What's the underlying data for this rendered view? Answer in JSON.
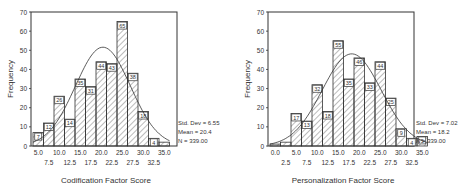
{
  "chart_data": [
    {
      "type": "bar",
      "subtype": "histogram",
      "title": "",
      "xlabel": "Codification Factor Score",
      "ylabel": "Frequency",
      "ylim": [
        0,
        70
      ],
      "yticks": [
        0,
        10,
        20,
        30,
        40,
        50,
        60,
        70
      ],
      "xticks_top_row": [
        "5.0",
        "10.0",
        "15.0",
        "20.0",
        "25.0",
        "30.0",
        "35.0"
      ],
      "xticks_bottom_row": [
        "7.5",
        "12.5",
        "17.5",
        "22.5",
        "27.5",
        "32.5"
      ],
      "categories": [
        5.0,
        7.5,
        10.0,
        12.5,
        15.0,
        17.5,
        20.0,
        22.5,
        25.0,
        27.5,
        30.0,
        32.5,
        35.0
      ],
      "values": [
        7,
        12,
        26,
        14,
        35,
        31,
        44,
        43,
        65,
        38,
        18,
        4,
        2
      ],
      "labels": [
        "7",
        "12",
        "26",
        "14",
        "35",
        "31",
        "44",
        "43",
        "65",
        "38",
        "18",
        "4",
        ""
      ],
      "normal_curve": {
        "mean": 20.4,
        "std": 6.55,
        "n": 339
      },
      "stats": [
        "Std. Dev = 6.55",
        "Mean = 20.4",
        "N = 339.00"
      ],
      "grid": false,
      "bar_fill": "diagonal-hatch"
    },
    {
      "type": "bar",
      "subtype": "histogram",
      "title": "",
      "xlabel": "Personalization Factor Score",
      "ylabel": "Frequency",
      "ylim": [
        0,
        70
      ],
      "yticks": [
        0,
        10,
        20,
        30,
        40,
        50,
        60,
        70
      ],
      "xticks_top_row": [
        "0.0",
        "5.0",
        "10.0",
        "15.0",
        "20.0",
        "25.0",
        "30.0",
        "35.0"
      ],
      "xticks_bottom_row": [
        "2.5",
        "7.5",
        "12.5",
        "17.5",
        "22.5",
        "27.5",
        "32.5"
      ],
      "categories": [
        0.0,
        2.5,
        5.0,
        7.5,
        10.0,
        12.5,
        15.0,
        17.5,
        20.0,
        22.5,
        25.0,
        27.5,
        30.0,
        32.5,
        35.0
      ],
      "values": [
        1,
        2,
        17,
        13,
        32,
        18,
        55,
        35,
        46,
        33,
        44,
        25,
        9,
        4,
        5
      ],
      "labels": [
        "",
        "",
        "17",
        "13",
        "32",
        "18",
        "55",
        "35",
        "46",
        "33",
        "44",
        "25",
        "9",
        "4",
        "5"
      ],
      "normal_curve": {
        "mean": 18.2,
        "std": 7.02,
        "n": 339
      },
      "stats": [
        "Std. Dev = 7.02",
        "Mean = 18.2",
        "N = 339.00"
      ],
      "grid": false,
      "bar_fill": "diagonal-hatch"
    }
  ],
  "colors": {
    "line": "#333333",
    "text": "#333333",
    "background": "#ffffff"
  }
}
